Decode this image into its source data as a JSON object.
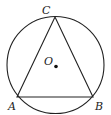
{
  "diagram": {
    "type": "geometry",
    "circle": {
      "center": "O"
    },
    "points": [
      {
        "label": "A"
      },
      {
        "label": "B"
      },
      {
        "label": "C"
      },
      {
        "label": "O"
      }
    ],
    "segments": [
      "AB",
      "BC",
      "CA"
    ]
  }
}
